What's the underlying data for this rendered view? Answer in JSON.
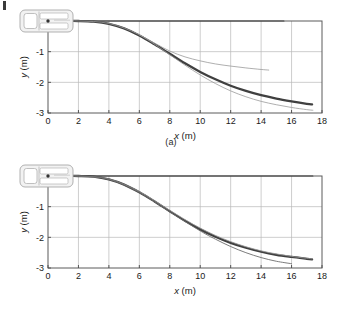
{
  "figure": {
    "panels": [
      {
        "id": "a",
        "caption": "(a)",
        "xlabel": "x (m)",
        "ylabel": "y (m)",
        "xticks": [
          "0",
          "2",
          "4",
          "6",
          "8",
          "10",
          "12",
          "14",
          "16",
          "18"
        ],
        "yticks": [
          "0",
          "-1",
          "-2",
          "-3"
        ],
        "vehicle_icon": "car-top-view-icon"
      },
      {
        "id": "b",
        "caption": "(b)",
        "xlabel": "x (m)",
        "ylabel": "y (m)",
        "xticks": [
          "0",
          "2",
          "4",
          "6",
          "8",
          "10",
          "12",
          "14",
          "16",
          "18"
        ],
        "yticks": [
          "0",
          "-1",
          "-2",
          "-3"
        ],
        "vehicle_icon": "car-top-view-icon"
      }
    ]
  },
  "chart_data": [
    {
      "type": "line",
      "panel": "a",
      "title": "(a)",
      "xlabel": "x (m)",
      "ylabel": "y (m)",
      "xlim": [
        0,
        18
      ],
      "ylim": [
        -3,
        0
      ],
      "xticks": [
        0,
        2,
        4,
        6,
        8,
        10,
        12,
        14,
        16,
        18
      ],
      "yticks": [
        0,
        -1,
        -2,
        -3
      ],
      "grid": true,
      "legend": "none",
      "series": [
        {
          "name": "reference-zero-line",
          "style": "thin-dark-horizontal",
          "x": [
            0,
            2,
            4,
            6,
            8,
            10,
            12,
            14,
            15.5
          ],
          "y": [
            0,
            0,
            0,
            0,
            0,
            0,
            0,
            0,
            0
          ]
        },
        {
          "name": "actual-path-thick",
          "style": "thick-dark",
          "x": [
            0,
            1,
            2,
            3,
            4,
            5,
            6,
            7,
            8,
            9,
            10,
            11,
            12,
            13,
            14,
            15,
            16,
            17,
            17.35
          ],
          "y": [
            0,
            0,
            0,
            -0.02,
            -0.09,
            -0.24,
            -0.47,
            -0.76,
            -1.07,
            -1.38,
            -1.66,
            -1.9,
            -2.11,
            -2.28,
            -2.42,
            -2.53,
            -2.62,
            -2.7,
            -2.72
          ]
        },
        {
          "name": "desired-path-thin",
          "style": "thin-grey",
          "x": [
            0,
            2,
            4,
            6,
            8,
            9,
            10,
            11,
            12,
            13,
            14,
            15,
            16,
            17,
            17.4
          ],
          "y": [
            0,
            0,
            -0.08,
            -0.45,
            -1.1,
            -1.44,
            -1.76,
            -2.04,
            -2.28,
            -2.47,
            -2.62,
            -2.73,
            -2.82,
            -2.89,
            -2.91
          ]
        },
        {
          "name": "divergent-path-thin",
          "style": "thin-grey",
          "x": [
            6,
            7,
            8,
            9,
            10,
            11,
            12,
            13,
            14,
            14.5
          ],
          "y": [
            -0.45,
            -0.72,
            -0.98,
            -1.17,
            -1.3,
            -1.4,
            -1.47,
            -1.53,
            -1.58,
            -1.6
          ]
        }
      ]
    },
    {
      "type": "line",
      "panel": "b",
      "title": "(b)",
      "xlabel": "x (m)",
      "ylabel": "y (m)",
      "xlim": [
        0,
        18
      ],
      "ylim": [
        -3,
        0
      ],
      "xticks": [
        0,
        2,
        4,
        6,
        8,
        10,
        12,
        14,
        16,
        18
      ],
      "yticks": [
        0,
        -1,
        -2,
        -3
      ],
      "grid": true,
      "legend": "none",
      "series": [
        {
          "name": "reference-zero-line",
          "style": "thin-dark-horizontal",
          "x": [
            0,
            2,
            4,
            6,
            8,
            10,
            12,
            14,
            16,
            17.4
          ],
          "y": [
            0,
            0,
            0,
            0,
            0,
            0,
            0,
            0,
            0,
            0
          ]
        },
        {
          "name": "actual-path-thick",
          "style": "thick-dark",
          "x": [
            0,
            1,
            2,
            3,
            4,
            5,
            6,
            7,
            8,
            9,
            10,
            11,
            12,
            13,
            14,
            15,
            16,
            17,
            17.35
          ],
          "y": [
            0,
            0,
            0,
            -0.02,
            -0.11,
            -0.28,
            -0.53,
            -0.83,
            -1.15,
            -1.46,
            -1.74,
            -1.98,
            -2.18,
            -2.34,
            -2.47,
            -2.57,
            -2.64,
            -2.7,
            -2.72
          ]
        },
        {
          "name": "desired-path-thin",
          "style": "thin-grey",
          "x": [
            0,
            2,
            4,
            6,
            8,
            10,
            12,
            14,
            16,
            17.35
          ],
          "y": [
            0,
            0,
            -0.1,
            -0.51,
            -1.12,
            -1.7,
            -2.14,
            -2.44,
            -2.62,
            -2.7
          ]
        },
        {
          "name": "alternate-path-thin",
          "style": "thin-dark",
          "x": [
            0,
            2,
            4,
            6,
            8,
            10,
            11,
            12,
            13,
            14,
            15,
            16
          ],
          "y": [
            0,
            0,
            -0.11,
            -0.54,
            -1.17,
            -1.79,
            -2.06,
            -2.3,
            -2.5,
            -2.66,
            -2.78,
            -2.86
          ]
        }
      ]
    }
  ]
}
